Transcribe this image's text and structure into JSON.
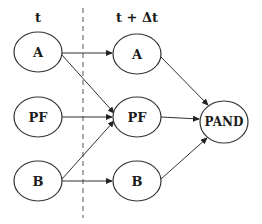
{
  "diagram": {
    "headers": {
      "left": "t",
      "right": "t + Δt"
    },
    "nodes": {
      "left_a": "A",
      "left_pf": "PF",
      "left_b": "B",
      "right_a": "A",
      "right_pf": "PF",
      "right_b": "B",
      "pand": "PAND"
    },
    "edges": [
      {
        "from": "left_a",
        "to": "right_a"
      },
      {
        "from": "left_a",
        "to": "right_pf"
      },
      {
        "from": "left_pf",
        "to": "right_pf"
      },
      {
        "from": "left_b",
        "to": "right_pf"
      },
      {
        "from": "left_b",
        "to": "right_b"
      },
      {
        "from": "right_a",
        "to": "pand"
      },
      {
        "from": "right_pf",
        "to": "pand"
      },
      {
        "from": "right_b",
        "to": "pand"
      }
    ]
  }
}
